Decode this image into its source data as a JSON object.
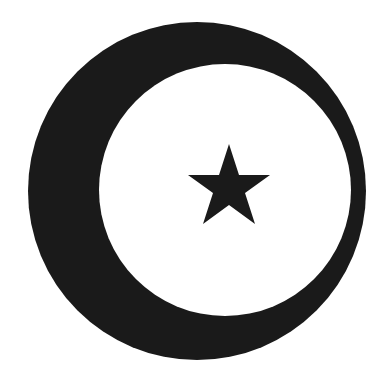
{
  "image": {
    "subject": "crescent and star",
    "colors": {
      "foreground": "#1a1a1a",
      "background": "#ffffff"
    }
  }
}
